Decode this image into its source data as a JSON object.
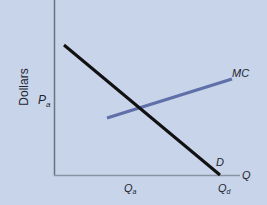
{
  "diagram": {
    "title": "",
    "y_axis_label": "Dollars",
    "x_axis_label": "Q",
    "price_label": "P",
    "price_subscript": "a",
    "quantity_a_label": "Q",
    "quantity_a_subscript": "a",
    "quantity_d_label": "Q",
    "quantity_d_subscript": "d",
    "curves": [
      {
        "name": "MC",
        "label": "MC",
        "color": "#5f6fa8",
        "from": [
          107,
          118
        ],
        "to": [
          232,
          79
        ]
      },
      {
        "name": "D",
        "label": "D",
        "color": "#111111",
        "from": [
          64,
          45
        ],
        "to": [
          220,
          175
        ]
      }
    ],
    "colors": {
      "background": "#c7d4ea",
      "axis": "#6b7280",
      "mc_line": "#5f6fa8",
      "demand_line": "#111111",
      "text": "#1f2430"
    }
  }
}
